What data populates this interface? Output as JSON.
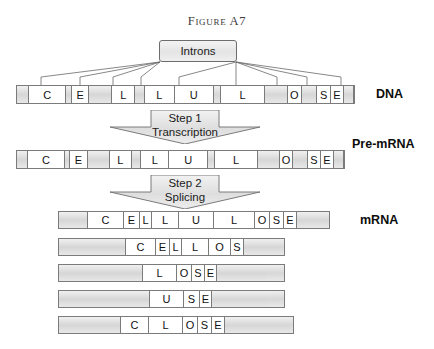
{
  "figure": {
    "title": "Figure A7",
    "callout": {
      "label": "Introns"
    },
    "steps": [
      {
        "number_label": "Step 1",
        "name_label": "Transcription"
      },
      {
        "number_label": "Step 2",
        "name_label": "Splicing"
      }
    ],
    "row_labels": {
      "dna": "DNA",
      "pre_mrna": "Pre-mRNA",
      "mrna": "mRNA"
    },
    "dna_sequence": {
      "label": "DNA",
      "segments": [
        {
          "type": "intron",
          "letter": ""
        },
        {
          "type": "exon",
          "letter": "C"
        },
        {
          "type": "intron",
          "letter": ""
        },
        {
          "type": "exon",
          "letter": "E"
        },
        {
          "type": "intron",
          "letter": ""
        },
        {
          "type": "exon",
          "letter": "L"
        },
        {
          "type": "intron",
          "letter": ""
        },
        {
          "type": "exon",
          "letter": "L"
        },
        {
          "type": "exon",
          "letter": "U"
        },
        {
          "type": "intron",
          "letter": ""
        },
        {
          "type": "exon",
          "letter": "L"
        },
        {
          "type": "intron",
          "letter": ""
        },
        {
          "type": "exon",
          "letter": "O"
        },
        {
          "type": "intron",
          "letter": ""
        },
        {
          "type": "exon",
          "letter": "S"
        },
        {
          "type": "exon",
          "letter": "E"
        },
        {
          "type": "intron",
          "letter": ""
        }
      ]
    },
    "pre_mrna_sequence": {
      "label": "Pre-mRNA",
      "segments": [
        {
          "type": "intron",
          "letter": ""
        },
        {
          "type": "exon",
          "letter": "C"
        },
        {
          "type": "intron",
          "letter": ""
        },
        {
          "type": "exon",
          "letter": "E"
        },
        {
          "type": "intron",
          "letter": ""
        },
        {
          "type": "exon",
          "letter": "L"
        },
        {
          "type": "intron",
          "letter": ""
        },
        {
          "type": "exon",
          "letter": "L"
        },
        {
          "type": "exon",
          "letter": "U"
        },
        {
          "type": "intron",
          "letter": ""
        },
        {
          "type": "exon",
          "letter": "L"
        },
        {
          "type": "intron",
          "letter": ""
        },
        {
          "type": "exon",
          "letter": "O"
        },
        {
          "type": "intron",
          "letter": ""
        },
        {
          "type": "exon",
          "letter": "S"
        },
        {
          "type": "exon",
          "letter": "E"
        },
        {
          "type": "intron",
          "letter": ""
        }
      ]
    },
    "mrna_sequences": [
      {
        "spelled": "CELLULOSE",
        "letters": [
          "C",
          "E",
          "L",
          "L",
          "U",
          "L",
          "O",
          "S",
          "E"
        ]
      },
      {
        "spelled": "CELLOS",
        "letters": [
          "C",
          "E",
          "L",
          "L",
          "O",
          "S"
        ]
      },
      {
        "spelled": "LOSE",
        "letters": [
          "L",
          "O",
          "S",
          "E"
        ]
      },
      {
        "spelled": "USE",
        "letters": [
          "U",
          "S",
          "E"
        ]
      },
      {
        "spelled": "CLOSE",
        "letters": [
          "C",
          "L",
          "O",
          "S",
          "E"
        ]
      }
    ]
  }
}
